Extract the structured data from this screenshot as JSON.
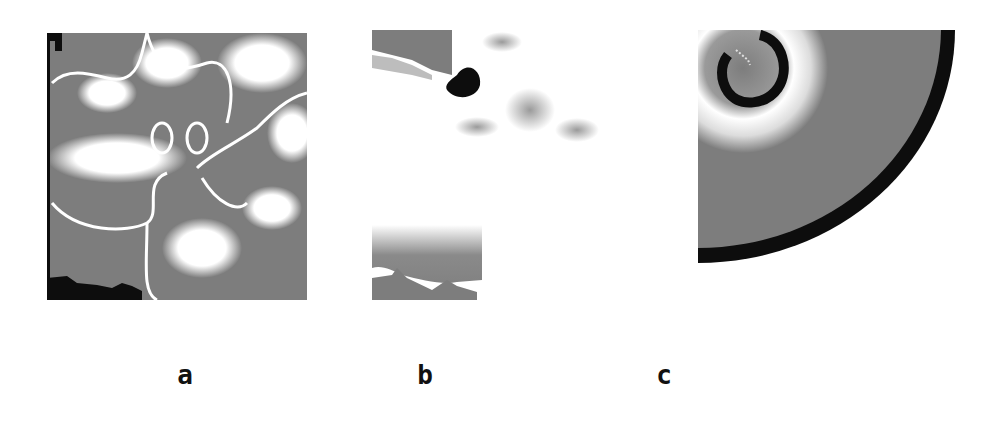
{
  "figure": {
    "panels": [
      {
        "id": "a",
        "label": "a",
        "description": "turbulent spiral wave pattern"
      },
      {
        "id": "b",
        "label": "b",
        "description": "mostly white field with single dark spiral tip"
      },
      {
        "id": "c",
        "label": "c",
        "description": "single rotating spiral with outer dark front"
      }
    ],
    "colors": {
      "gray": "#7d7d7d",
      "white": "#ffffff",
      "black": "#0d0d0d"
    }
  }
}
